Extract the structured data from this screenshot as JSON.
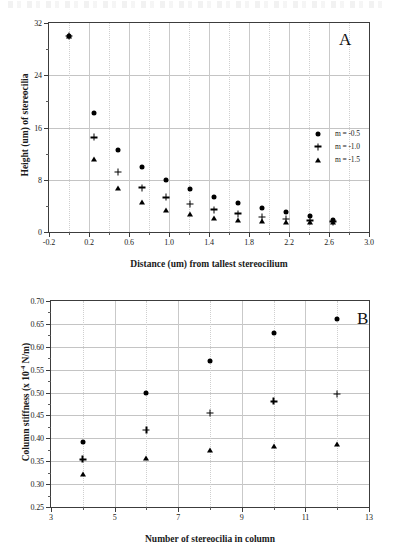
{
  "figure": {
    "panels": [
      "A",
      "B"
    ]
  },
  "panel_a": {
    "letter": "A",
    "xlabel": "Distance (um) from tallest stereocilium",
    "ylabel": "Height (um) of stereocilia",
    "xticks": [
      "-0.2",
      "0.2",
      "0.6",
      "1.0",
      "1.4",
      "1.8",
      "2.2",
      "2.6",
      "3.0"
    ],
    "yticks": [
      "0",
      "8",
      "16",
      "24",
      "32"
    ],
    "legend": [
      {
        "marker": "circle",
        "label": "m = -0.5"
      },
      {
        "marker": "plus",
        "label": "m = -1.0"
      },
      {
        "marker": "triangle",
        "label": "m = -1.5"
      }
    ]
  },
  "panel_b": {
    "letter": "B",
    "xlabel": "Number of stereocilia in column",
    "ylabel_prefix": "Column stiffness (x 10",
    "ylabel_exponent": "-4",
    "ylabel_suffix": " N/m)",
    "xticks": [
      "3",
      "5",
      "7",
      "9",
      "11",
      "13"
    ],
    "yticks": [
      "0.25",
      "0.30",
      "0.35",
      "0.40",
      "0.45",
      "0.50",
      "0.55",
      "0.60",
      "0.65",
      "0.70"
    ]
  },
  "chart_data": [
    {
      "type": "scatter",
      "panel": "A",
      "title": "",
      "xlabel": "Distance (um) from tallest stereocilium",
      "ylabel": "Height (um) of stereocilia",
      "xlim": [
        -0.2,
        3.0
      ],
      "ylim": [
        0,
        32
      ],
      "xticks": [
        -0.2,
        0.2,
        0.6,
        1.0,
        1.4,
        1.8,
        2.2,
        2.6,
        3.0
      ],
      "yticks": [
        0,
        8,
        16,
        24,
        32
      ],
      "grid": true,
      "legend_position": "right-upper",
      "series": [
        {
          "name": "m = -0.5",
          "marker": "circle",
          "x": [
            0.0,
            0.25,
            0.49,
            0.73,
            0.97,
            1.21,
            1.45,
            1.69,
            1.93,
            2.17,
            2.41,
            2.64
          ],
          "y": [
            30.0,
            18.2,
            12.6,
            9.9,
            7.9,
            6.6,
            5.4,
            4.4,
            3.6,
            3.0,
            2.4,
            1.9
          ]
        },
        {
          "name": "m = -1.0",
          "marker": "plus",
          "x": [
            0.0,
            0.25,
            0.49,
            0.73,
            0.97,
            1.21,
            1.45,
            1.69,
            1.93,
            2.17,
            2.41,
            2.64
          ],
          "y": [
            30.0,
            14.5,
            9.2,
            6.8,
            5.3,
            4.3,
            3.4,
            2.8,
            2.3,
            2.0,
            1.7,
            1.6
          ]
        },
        {
          "name": "m = -1.5",
          "marker": "triangle",
          "x": [
            0.0,
            0.25,
            0.49,
            0.73,
            0.97,
            1.21,
            1.45,
            1.69,
            1.93,
            2.17,
            2.41,
            2.64
          ],
          "y": [
            30.0,
            11.2,
            6.7,
            4.6,
            3.3,
            2.7,
            2.1,
            1.9,
            1.7,
            1.6,
            1.5,
            1.5
          ]
        }
      ]
    },
    {
      "type": "scatter",
      "panel": "B",
      "title": "",
      "xlabel": "Number of stereocilia in column",
      "ylabel": "Column stiffness (x 10^-4 N/m)",
      "xlim": [
        3,
        13
      ],
      "ylim": [
        0.25,
        0.7
      ],
      "xticks": [
        3,
        5,
        7,
        9,
        11,
        13
      ],
      "yticks": [
        0.25,
        0.3,
        0.35,
        0.4,
        0.45,
        0.5,
        0.55,
        0.6,
        0.65,
        0.7
      ],
      "grid": true,
      "legend_position": "none",
      "series": [
        {
          "name": "m = -0.5",
          "marker": "circle",
          "x": [
            4,
            6,
            8,
            10,
            12
          ],
          "y": [
            0.391,
            0.5,
            0.57,
            0.63,
            0.66
          ]
        },
        {
          "name": "m = -1.0",
          "marker": "plus",
          "x": [
            4,
            6,
            8,
            10,
            12
          ],
          "y": [
            0.354,
            0.418,
            0.455,
            0.481,
            0.497
          ]
        },
        {
          "name": "m = -1.5",
          "marker": "triangle",
          "x": [
            4,
            6,
            8,
            10,
            12
          ],
          "y": [
            0.322,
            0.357,
            0.375,
            0.384,
            0.388
          ]
        }
      ]
    }
  ]
}
